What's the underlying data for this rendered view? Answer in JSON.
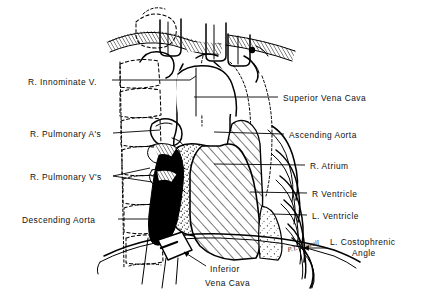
{
  "figure": {
    "kind": "anatomical-line-drawing",
    "background_color": "#ffffff",
    "ink_color": "#000000",
    "signature": "P.T. Dowell"
  },
  "labels_left": [
    {
      "id": "r-innominate-vein",
      "text": "R. Innominate V.",
      "x": 28,
      "y": 82,
      "leader_to_x": 190,
      "leader_to_y": 83
    },
    {
      "id": "r-pulmonary-arteries",
      "text": "R. Pulmonary A's",
      "x": 30,
      "y": 136,
      "leader_to_x": 163,
      "leader_to_y": 132
    },
    {
      "id": "r-pulmonary-veins",
      "text": "R. Pulmonary V's",
      "x": 30,
      "y": 179,
      "leader_to_x": 166,
      "leader_to_y": 172
    },
    {
      "id": "descending-aorta",
      "text": "Descending Aorta",
      "x": 22,
      "y": 222,
      "leader_to_x": 174,
      "leader_to_y": 221
    }
  ],
  "labels_right": [
    {
      "id": "superior-vena-cava",
      "text": "Superior Vena Cava",
      "x": 283,
      "y": 100,
      "leader_to_x": 190,
      "leader_to_y": 97
    },
    {
      "id": "ascending-aorta",
      "text": "Ascending Aorta",
      "x": 289,
      "y": 137,
      "leader_to_x": 214,
      "leader_to_y": 134
    },
    {
      "id": "r-atrium",
      "text": "R. Atrium",
      "x": 310,
      "y": 168,
      "leader_to_x": 213,
      "leader_to_y": 166
    },
    {
      "id": "r-ventricle",
      "text": "R Ventricle",
      "x": 312,
      "y": 196,
      "leader_to_x": 250,
      "leader_to_y": 194
    },
    {
      "id": "l-ventricle",
      "text": "L. Ventricle",
      "x": 312,
      "y": 218,
      "leader_to_x": 270,
      "leader_to_y": 216
    }
  ],
  "labels_other": [
    {
      "id": "l-costophrenic-angle",
      "line1": "L. Costophrenic",
      "line2": "Angle",
      "x": 330,
      "y": 243,
      "arrow_from_x": 326,
      "arrow_from_y": 248,
      "arrow_to_x": 303,
      "arrow_to_y": 248
    },
    {
      "id": "inferior-vena-cava",
      "line1": "Inferior",
      "line2": "Vena Cava",
      "x": 208,
      "y": 270,
      "arrow_from_x": 205,
      "arrow_from_y": 265,
      "arrow_to_x": 183,
      "arrow_to_y": 253
    }
  ],
  "regions": [
    {
      "id": "r-atrium-region",
      "fill_style": "stipple",
      "description": "Right atrium, stippled shading"
    },
    {
      "id": "r-ventricle-region",
      "fill_style": "diagonal-hatch",
      "description": "Right ventricle, diagonal line hatching"
    },
    {
      "id": "l-ventricle-region",
      "fill_style": "stipple",
      "description": "Left ventricle margin, stippled"
    },
    {
      "id": "descending-aorta-region",
      "fill_style": "solid-black",
      "description": "Descending aorta shadow, solid black"
    },
    {
      "id": "clavicle-region",
      "fill_style": "fine-hatch",
      "description": "Clavicles with fine hatch shading"
    },
    {
      "id": "vertebral-column",
      "fill_style": "dashed-outline",
      "description": "Thoracic vertebrae drawn as dashed outlines"
    },
    {
      "id": "rib-cage-right",
      "fill_style": "outline",
      "description": "Left-sided ribs drawn as nested curved outlines"
    },
    {
      "id": "diaphragm",
      "fill_style": "outline",
      "description": "Diaphragm / hemidiaphragm sweeping curve"
    }
  ]
}
